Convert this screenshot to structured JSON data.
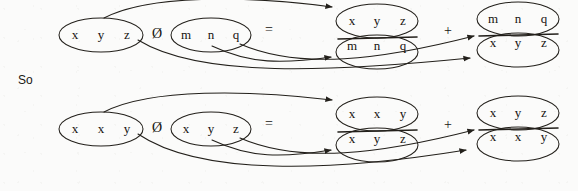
{
  "figure": {
    "title_text": "So",
    "operator_concat": "Ø",
    "operator_equals": "=",
    "operator_plus": "+",
    "rows": [
      {
        "id": "row-1",
        "left_operand": {
          "id": "t1",
          "cells": [
            "x",
            "y",
            "z"
          ]
        },
        "right_operand": {
          "id": "t2",
          "cells": [
            "m",
            "n",
            "q"
          ]
        },
        "result_terms": [
          {
            "id": "term-1",
            "numerator": {
              "id": "t3",
              "cells": [
                "x",
                "y",
                "z"
              ]
            },
            "denominator": {
              "id": "t4",
              "cells": [
                "m",
                "n",
                "q"
              ]
            }
          },
          {
            "id": "term-2",
            "numerator": {
              "id": "t5",
              "cells": [
                "m",
                "n",
                "q"
              ]
            },
            "denominator": {
              "id": "t6",
              "cells": [
                "x",
                "y",
                "z"
              ]
            }
          }
        ]
      },
      {
        "id": "row-2",
        "left_operand": {
          "id": "b1",
          "cells": [
            "x",
            "x",
            "y"
          ]
        },
        "right_operand": {
          "id": "b2",
          "cells": [
            "x",
            "y",
            "z"
          ]
        },
        "result_terms": [
          {
            "id": "term-3",
            "numerator": {
              "id": "b3",
              "cells": [
                "x",
                "x",
                "y"
              ]
            },
            "denominator": {
              "id": "b4",
              "cells": [
                "x",
                "y",
                "z"
              ]
            }
          },
          {
            "id": "term-4",
            "numerator": {
              "id": "b5",
              "cells": [
                "x",
                "y",
                "z"
              ]
            },
            "denominator": {
              "id": "b6",
              "cells": [
                "x",
                "x",
                "y"
              ]
            }
          }
        ]
      }
    ],
    "colors": {
      "ink": "#23201b",
      "text": "#15130f",
      "paper": "#fbfbfa"
    }
  }
}
